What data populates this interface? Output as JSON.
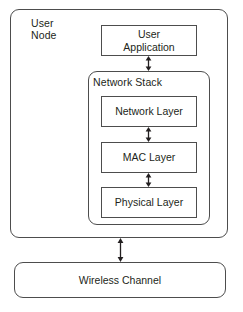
{
  "diagram": {
    "background_color": "#ffffff",
    "stroke_color": "#4d4d4d",
    "text_color": "#231f20"
  },
  "user_node": {
    "label": "User\nNode",
    "shape": "rounded-rectangle"
  },
  "user_application": {
    "label": "User\nApplication",
    "shape": "rectangle"
  },
  "network_stack": {
    "label": "Network Stack",
    "shape": "rounded-rectangle",
    "layers": [
      {
        "label": "Network Layer"
      },
      {
        "label": "MAC Layer"
      },
      {
        "label": "Physical Layer"
      }
    ]
  },
  "wireless_channel": {
    "label": "Wireless Channel",
    "shape": "rounded-rectangle"
  },
  "connectors": [
    {
      "name": "user-application-to-network-stack",
      "style": "double-headed-arrow",
      "orientation": "vertical"
    },
    {
      "name": "network-layer-to-mac-layer",
      "style": "double-headed-arrow",
      "orientation": "vertical"
    },
    {
      "name": "mac-layer-to-physical-layer",
      "style": "double-headed-arrow",
      "orientation": "vertical"
    },
    {
      "name": "user-node-to-wireless-channel",
      "style": "double-headed-arrow",
      "orientation": "vertical"
    }
  ]
}
